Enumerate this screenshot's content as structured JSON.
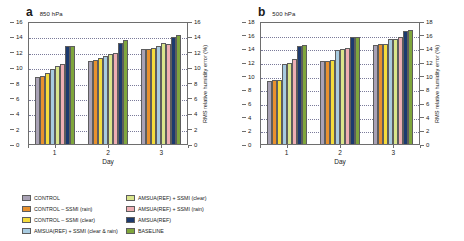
{
  "figure": {
    "ylabel": "RMS relative humidity error (%)",
    "xlabel": "Day",
    "series_names": [
      "CONTROL",
      "CONTROL – SSMI (rain)",
      "CONTROL – SSMI (clear)",
      "AMSUA(REF) + SSMI (clear & rain)",
      "AMSUA(REF) + SSMI (clear)",
      "AMSUA(REF) + SSMI (rain)",
      "AMSUA(REF)",
      "BASELINE"
    ],
    "series_colors": [
      "#a9a2b5",
      "#e8912e",
      "#f4dc3c",
      "#a8cbe0",
      "#d9e58b",
      "#eeaeb3",
      "#1c3a6e",
      "#7fa63c"
    ],
    "legend_columns": [
      [
        {
          "label": "CONTROL",
          "color": "#a9a2b5"
        },
        {
          "label": "CONTROL – SSMI (rain)",
          "color": "#e8912e"
        },
        {
          "label": "CONTROL – SSMI (clear)",
          "color": "#f4dc3c"
        },
        {
          "label": "AMSUA(REF) + SSMI (clear & rain)",
          "color": "#a8cbe0"
        }
      ],
      [
        {
          "label": "AMSUA(REF) + SSMI (clear)",
          "color": "#d9e58b"
        },
        {
          "label": "AMSUA(REF) + SSMI (rain)",
          "color": "#eeaeb3"
        },
        {
          "label": "AMSUA(REF)",
          "color": "#1c3a6e"
        },
        {
          "label": "BASELINE",
          "color": "#7fa63c"
        }
      ]
    ]
  },
  "chart_data": [
    {
      "type": "bar",
      "panel_letter": "a",
      "title": "850 hPa",
      "xlabel": "Day",
      "ylabel": "RMS relative humidity error (%)",
      "categories": [
        "1",
        "2",
        "3"
      ],
      "ylim": [
        0,
        16
      ],
      "yticks": [
        0,
        2,
        4,
        6,
        8,
        10,
        12,
        14,
        16
      ],
      "grid": true,
      "legend_position": "below",
      "series": [
        {
          "name": "CONTROL",
          "color": "#a9a2b5",
          "values": [
            8.7,
            10.8,
            12.4
          ]
        },
        {
          "name": "CONTROL – SSMI (rain)",
          "color": "#e8912e",
          "values": [
            8.8,
            10.9,
            12.4
          ]
        },
        {
          "name": "CONTROL – SSMI (clear)",
          "color": "#f4dc3c",
          "values": [
            9.2,
            11.2,
            12.5
          ]
        },
        {
          "name": "AMSUA(REF) + SSMI (clear & rain)",
          "color": "#a8cbe0",
          "values": [
            9.8,
            11.5,
            12.7
          ]
        },
        {
          "name": "AMSUA(REF) + SSMI (clear)",
          "color": "#d9e58b",
          "values": [
            10.1,
            11.7,
            13.1
          ]
        },
        {
          "name": "AMSUA(REF) + SSMI (rain)",
          "color": "#eeaeb3",
          "values": [
            10.4,
            11.9,
            13.0
          ]
        },
        {
          "name": "AMSUA(REF)",
          "color": "#1c3a6e",
          "values": [
            12.7,
            13.2,
            13.9
          ]
        },
        {
          "name": "BASELINE",
          "color": "#7fa63c",
          "values": [
            12.8,
            13.5,
            14.2
          ]
        }
      ]
    },
    {
      "type": "bar",
      "panel_letter": "b",
      "title": "500 hPa",
      "xlabel": "Day",
      "ylabel": "RMS relative humidity error (%)",
      "categories": [
        "1",
        "2",
        "3"
      ],
      "ylim": [
        0,
        18
      ],
      "yticks": [
        0,
        2,
        4,
        6,
        8,
        10,
        12,
        14,
        16,
        18
      ],
      "grid": true,
      "legend_position": "below",
      "series": [
        {
          "name": "CONTROL",
          "color": "#a9a2b5",
          "values": [
            9.2,
            12.2,
            14.5
          ]
        },
        {
          "name": "CONTROL – SSMI (rain)",
          "color": "#e8912e",
          "values": [
            9.3,
            12.2,
            14.6
          ]
        },
        {
          "name": "CONTROL – SSMI (clear)",
          "color": "#f4dc3c",
          "values": [
            9.4,
            12.3,
            14.6
          ]
        },
        {
          "name": "AMSUA(REF) + SSMI (clear & rain)",
          "color": "#a8cbe0",
          "values": [
            11.7,
            13.8,
            15.3
          ]
        },
        {
          "name": "AMSUA(REF) + SSMI (clear)",
          "color": "#d9e58b",
          "values": [
            11.9,
            13.9,
            15.4
          ]
        },
        {
          "name": "AMSUA(REF) + SSMI (rain)",
          "color": "#eeaeb3",
          "values": [
            12.4,
            14.1,
            15.6
          ]
        },
        {
          "name": "AMSUA(REF)",
          "color": "#1c3a6e",
          "values": [
            14.4,
            15.7,
            16.6
          ]
        },
        {
          "name": "BASELINE",
          "color": "#7fa63c",
          "values": [
            14.5,
            15.7,
            16.7
          ]
        }
      ]
    }
  ]
}
